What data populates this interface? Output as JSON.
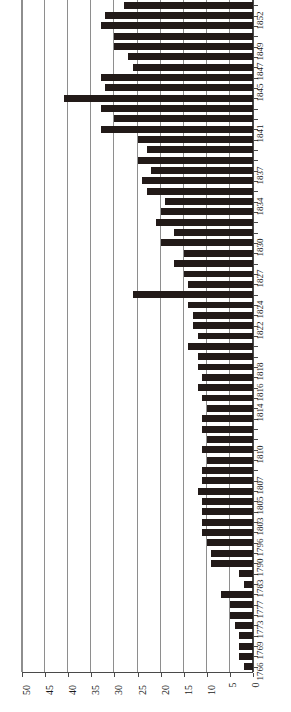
{
  "chart_data": {
    "type": "bar",
    "orientation": "horizontal-rotated",
    "title": "",
    "subtitle": "",
    "xlabel": "",
    "ylabel": "",
    "value_axis": {
      "min": 0,
      "max": 50,
      "tick_step": 5,
      "ticks": [
        50,
        45,
        40,
        35,
        30,
        25,
        20,
        15,
        10,
        5,
        0
      ],
      "tick_labels": [
        "50",
        "45",
        "40",
        "35",
        "30",
        "25",
        "20",
        "15",
        "10",
        "5",
        "0"
      ],
      "direction": "right-to-left",
      "grid": true
    },
    "category_axis": {
      "name": "year",
      "labelled_ticks": [
        "1852",
        "1849",
        "1847",
        "1845",
        "1841",
        "1837",
        "1834",
        "1830",
        "1827",
        "1824",
        "1822",
        "1818",
        "1816",
        "1814",
        "1810",
        "1807",
        "1805",
        "1803",
        "1796",
        "1790",
        "1783",
        "1777",
        "1773",
        "1769",
        "1766"
      ],
      "grid": false,
      "order": "newest-at-top"
    },
    "legend": {
      "visible": false,
      "entries": []
    },
    "annotations": [],
    "categories": [
      "1853",
      "1852",
      "1851",
      "1850",
      "1849",
      "1848",
      "1847",
      "1846",
      "1845",
      "1844",
      "1843",
      "1842",
      "1841",
      "1840",
      "1839",
      "1838",
      "1837",
      "1836",
      "1835",
      "1834",
      "1833",
      "1832",
      "1831",
      "1830",
      "1829",
      "1828",
      "1827",
      "1826",
      "1825",
      "1824",
      "1823",
      "1822",
      "1821",
      "1820",
      "1819",
      "1818",
      "1817",
      "1816",
      "1815",
      "1814",
      "1813",
      "1812",
      "1811",
      "1810",
      "1809",
      "1808",
      "1807",
      "1806",
      "1805",
      "1804",
      "1803",
      "1802",
      "1796",
      "1793",
      "1790",
      "1786",
      "1783",
      "1781",
      "1777",
      "1775",
      "1773",
      "1771",
      "1769",
      "1768",
      "1766"
    ],
    "values": [
      28,
      32,
      33,
      30,
      30,
      27,
      26,
      33,
      32,
      41,
      33,
      30,
      33,
      25,
      23,
      25,
      22,
      24,
      23,
      19,
      20,
      21,
      17,
      20,
      15,
      17,
      15,
      14,
      26,
      14,
      13,
      13,
      12,
      14,
      12,
      12,
      11,
      12,
      11,
      10,
      11,
      11,
      10,
      11,
      10,
      11,
      11,
      12,
      11,
      11,
      11,
      11,
      10,
      9,
      9,
      3,
      2,
      7,
      5,
      5,
      4,
      3,
      3,
      3,
      2
    ]
  }
}
